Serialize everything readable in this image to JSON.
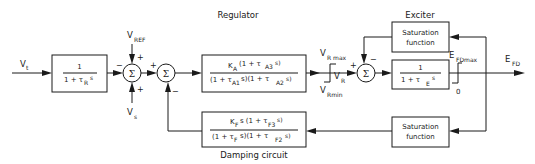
{
  "title_labels": {
    "regulator": "Regulator",
    "exciter": "Exciter",
    "damping": "Damping circuit"
  },
  "signals": {
    "vt": "V",
    "vt_sub": "t",
    "vref": "V",
    "vref_sub": "REF",
    "vs": "V",
    "vs_sub": "s",
    "vr": "V",
    "vr_sub": "R",
    "vrmax": "V",
    "vrmax_sub": "R max",
    "vrmin": "V",
    "vrmin_sub": "Rmin",
    "efd": "E",
    "efd_sub": "FD",
    "efdmax": "E",
    "efdmax_sub": "FDmax",
    "zero": "0"
  },
  "blocks": {
    "transducer": {
      "num": "1",
      "den": "1 + τ",
      "den_sub": "R",
      "den_tail": "s"
    },
    "regulator": {
      "num": "K",
      "num_sub": "A",
      "num_tail": " (1 + τ",
      "num_sub2": "A3",
      "num_end": "s)",
      "den": "(1 + τ",
      "den_sub1": "A1",
      "den_mid": "s)(1 + τ",
      "den_sub2": "A2",
      "den_end": "s)"
    },
    "exciter": {
      "num": "1",
      "den": "1 +  τ",
      "den_sub": "E",
      "den_tail": "s"
    },
    "exciter_saturation": {
      "line1": "Saturation",
      "line2": "function"
    },
    "damping": {
      "num": "K",
      "num_sub": "F",
      "num_tail": "s (1 + τ",
      "num_sub2": "F3",
      "num_end": "s)",
      "den": "(1 + τ",
      "den_sub1": "F",
      "den_mid": "s)(1 + τ",
      "den_sub2": "F2",
      "den_end": "s)"
    },
    "feedback_saturation": {
      "line1": "Saturation",
      "line2": "function"
    }
  },
  "summing_junctions": {
    "symbol": "Σ",
    "j1": {
      "left": "−",
      "top": "+",
      "bottom": "+"
    },
    "j2": {
      "left": "+",
      "bottom": "−"
    },
    "j3": {
      "left": "+",
      "top": "−"
    }
  }
}
